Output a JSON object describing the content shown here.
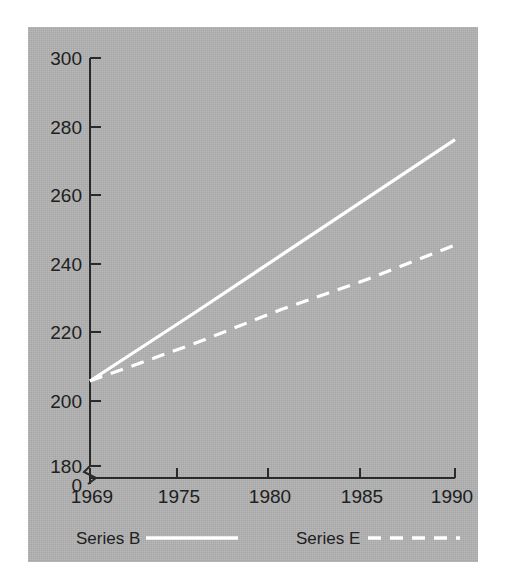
{
  "figure": {
    "background_color": "#ffffff",
    "panel_color": "#b2b2b2",
    "axis_color": "#2a2a2a",
    "series_color": "#ffffff"
  },
  "chart_data": {
    "type": "line",
    "title": "",
    "subtitle": "",
    "xlabel": "",
    "ylabel": "",
    "x": [
      1969,
      1975,
      1980,
      1985,
      1990
    ],
    "xlim": [
      1969,
      1990
    ],
    "ylim": [
      180,
      300
    ],
    "y_axis_break": true,
    "y_break_label": "0",
    "grid": false,
    "legend_position": "bottom",
    "xticks": [
      1969,
      1975,
      1980,
      1985,
      1990
    ],
    "xtick_labels": [
      "1969",
      "1975",
      "1980",
      "1985",
      "1990"
    ],
    "yticks": [
      180,
      200,
      220,
      240,
      260,
      280,
      300
    ],
    "ytick_labels": [
      "180",
      "200",
      "220",
      "240",
      "260",
      "280",
      "300"
    ],
    "series": [
      {
        "name": "Series B",
        "style": "solid",
        "color": "#ffffff",
        "x": [
          1969,
          1975,
          1980,
          1985,
          1990
        ],
        "values": [
          205,
          225,
          242,
          259,
          276
        ]
      },
      {
        "name": "Series E",
        "style": "dashed",
        "color": "#ffffff",
        "x": [
          1969,
          1975,
          1980,
          1985,
          1990
        ],
        "values": [
          205,
          216,
          226,
          235,
          245
        ]
      }
    ]
  },
  "ytick_labels": {
    "t300": "300",
    "t280": "280",
    "t260": "260",
    "t240": "240",
    "t220": "220",
    "t200": "200",
    "t180": "180",
    "t0": "0"
  },
  "xtick_labels": {
    "t1969": "1969",
    "t1975": "1975",
    "t1980": "1980",
    "t1985": "1985",
    "t1990": "1990"
  },
  "legend": {
    "items": [
      {
        "label": "Series B",
        "style": "solid"
      },
      {
        "label": "Series E",
        "style": "dashed"
      }
    ]
  }
}
